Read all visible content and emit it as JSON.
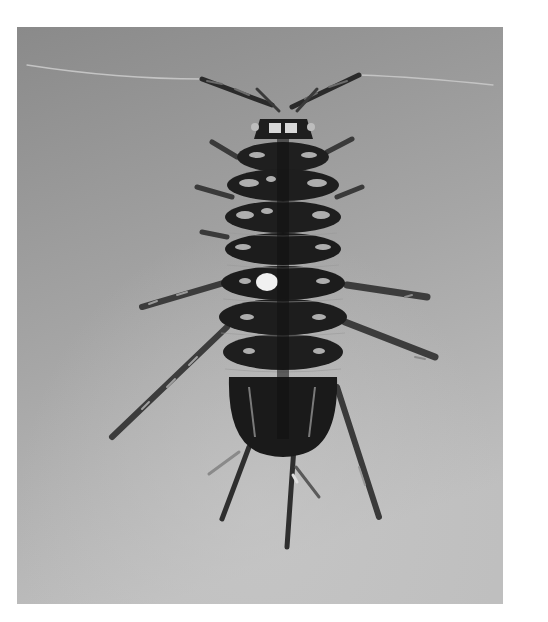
{
  "image": {
    "subject": "isopod",
    "description": "Black-and-white photograph of a mottled aquatic isopod (water louse) viewed dorsally, with long antennae and jointed legs, on a grey background",
    "palette": {
      "background_top": "#8c8c8c",
      "background_bottom": "#bdbdbd",
      "body_dark": "#1e1e1e",
      "body_mottle": "#cfcfcf",
      "page": "#ffffff"
    }
  }
}
